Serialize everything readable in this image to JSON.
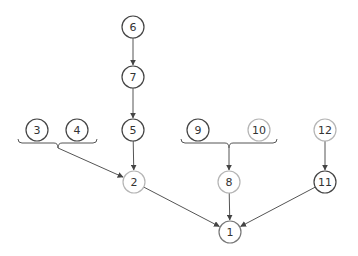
{
  "diagram": {
    "type": "tree",
    "colors": {
      "dark": "#444444",
      "medium": "#777777",
      "light": "#b5b5b5",
      "edge": "#555555"
    },
    "nodes": [
      {
        "id": "1",
        "label": "1",
        "x": 230,
        "y": 232,
        "tone": "medium"
      },
      {
        "id": "2",
        "label": "2",
        "x": 134,
        "y": 182,
        "tone": "light"
      },
      {
        "id": "3",
        "label": "3",
        "x": 37,
        "y": 130,
        "tone": "dark"
      },
      {
        "id": "4",
        "label": "4",
        "x": 77,
        "y": 130,
        "tone": "dark"
      },
      {
        "id": "5",
        "label": "5",
        "x": 133,
        "y": 130,
        "tone": "dark"
      },
      {
        "id": "6",
        "label": "6",
        "x": 133,
        "y": 27,
        "tone": "dark"
      },
      {
        "id": "7",
        "label": "7",
        "x": 133,
        "y": 77,
        "tone": "dark"
      },
      {
        "id": "8",
        "label": "8",
        "x": 229,
        "y": 182,
        "tone": "light"
      },
      {
        "id": "9",
        "label": "9",
        "x": 198,
        "y": 130,
        "tone": "dark"
      },
      {
        "id": "10",
        "label": "10",
        "x": 259,
        "y": 130,
        "tone": "light"
      },
      {
        "id": "11",
        "label": "11",
        "x": 325,
        "y": 182,
        "tone": "dark"
      },
      {
        "id": "12",
        "label": "12",
        "x": 325,
        "y": 130,
        "tone": "light"
      }
    ],
    "groups": [
      {
        "id": "group-3-4",
        "members": [
          "3",
          "4"
        ],
        "x1": 18,
        "x2": 97,
        "y": 143,
        "tip_x": 58
      },
      {
        "id": "group-9-10",
        "members": [
          "9",
          "10"
        ],
        "x1": 181,
        "x2": 277,
        "y": 143,
        "tip_x": 229
      }
    ],
    "edges": [
      {
        "from": "6",
        "to": "7"
      },
      {
        "from": "7",
        "to": "5"
      },
      {
        "from": "5",
        "to": "2"
      },
      {
        "from": "group-3-4",
        "to": "2"
      },
      {
        "from": "group-9-10",
        "to": "8"
      },
      {
        "from": "12",
        "to": "11"
      },
      {
        "from": "2",
        "to": "1"
      },
      {
        "from": "8",
        "to": "1"
      },
      {
        "from": "11",
        "to": "1"
      }
    ]
  }
}
